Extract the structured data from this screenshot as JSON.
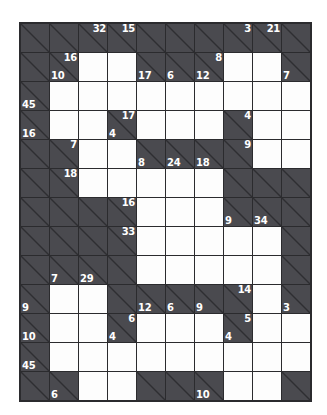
{
  "puzzle": {
    "type": "kakuro",
    "columns": 10,
    "rows": 13,
    "colors": {
      "open_cell": "#fdfdfd",
      "clue_cell": "#4a4a4f",
      "grid_line": "#2b2b2e",
      "clue_text": "#ffffff",
      "page_background": "#ffffff"
    },
    "grid": [
      [
        {
          "kind": "block"
        },
        {
          "kind": "block"
        },
        {
          "kind": "clue",
          "down": "32"
        },
        {
          "kind": "clue",
          "down": "15"
        },
        {
          "kind": "block"
        },
        {
          "kind": "block"
        },
        {
          "kind": "block"
        },
        {
          "kind": "clue",
          "down": "3"
        },
        {
          "kind": "clue",
          "down": "21"
        },
        {
          "kind": "block"
        }
      ],
      [
        {
          "kind": "block"
        },
        {
          "kind": "clue",
          "down": "16",
          "across": "10"
        },
        {
          "kind": "open"
        },
        {
          "kind": "open"
        },
        {
          "kind": "clue",
          "across": "17"
        },
        {
          "kind": "clue",
          "across": "6"
        },
        {
          "kind": "clue",
          "down": "8",
          "across": "12"
        },
        {
          "kind": "open"
        },
        {
          "kind": "open"
        },
        {
          "kind": "clue",
          "across": "7"
        }
      ],
      [
        {
          "kind": "clue",
          "across": "45"
        },
        {
          "kind": "open"
        },
        {
          "kind": "open"
        },
        {
          "kind": "open"
        },
        {
          "kind": "open"
        },
        {
          "kind": "open"
        },
        {
          "kind": "open"
        },
        {
          "kind": "open"
        },
        {
          "kind": "open"
        },
        {
          "kind": "open"
        }
      ],
      [
        {
          "kind": "clue",
          "across": "16"
        },
        {
          "kind": "open"
        },
        {
          "kind": "open"
        },
        {
          "kind": "clue",
          "down": "17",
          "across": "4"
        },
        {
          "kind": "open"
        },
        {
          "kind": "open"
        },
        {
          "kind": "open"
        },
        {
          "kind": "clue",
          "down": "4"
        },
        {
          "kind": "open"
        },
        {
          "kind": "open"
        }
      ],
      [
        {
          "kind": "block"
        },
        {
          "kind": "clue",
          "down": "7"
        },
        {
          "kind": "open"
        },
        {
          "kind": "open"
        },
        {
          "kind": "clue",
          "across": "8"
        },
        {
          "kind": "clue",
          "across": "24"
        },
        {
          "kind": "clue",
          "across": "18"
        },
        {
          "kind": "clue",
          "down": "9"
        },
        {
          "kind": "open"
        },
        {
          "kind": "open"
        }
      ],
      [
        {
          "kind": "block"
        },
        {
          "kind": "clue",
          "down": "18"
        },
        {
          "kind": "open"
        },
        {
          "kind": "open"
        },
        {
          "kind": "open"
        },
        {
          "kind": "open"
        },
        {
          "kind": "open"
        },
        {
          "kind": "block"
        },
        {
          "kind": "block"
        },
        {
          "kind": "block"
        }
      ],
      [
        {
          "kind": "block"
        },
        {
          "kind": "block"
        },
        {
          "kind": "block"
        },
        {
          "kind": "clue",
          "down": "16"
        },
        {
          "kind": "open"
        },
        {
          "kind": "open"
        },
        {
          "kind": "open"
        },
        {
          "kind": "clue",
          "across": "9"
        },
        {
          "kind": "clue",
          "across": "34"
        },
        {
          "kind": "block"
        }
      ],
      [
        {
          "kind": "block"
        },
        {
          "kind": "block"
        },
        {
          "kind": "block"
        },
        {
          "kind": "clue",
          "down": "33"
        },
        {
          "kind": "open"
        },
        {
          "kind": "open"
        },
        {
          "kind": "open"
        },
        {
          "kind": "open"
        },
        {
          "kind": "open"
        },
        {
          "kind": "block"
        }
      ],
      [
        {
          "kind": "block"
        },
        {
          "kind": "clue",
          "across": "7"
        },
        {
          "kind": "clue",
          "across": "29"
        },
        {
          "kind": "block"
        },
        {
          "kind": "open"
        },
        {
          "kind": "open"
        },
        {
          "kind": "open"
        },
        {
          "kind": "open"
        },
        {
          "kind": "open"
        },
        {
          "kind": "block"
        }
      ],
      [
        {
          "kind": "clue",
          "across": "9"
        },
        {
          "kind": "open"
        },
        {
          "kind": "open"
        },
        {
          "kind": "block"
        },
        {
          "kind": "clue",
          "across": "12"
        },
        {
          "kind": "clue",
          "across": "6"
        },
        {
          "kind": "clue",
          "across": "9"
        },
        {
          "kind": "clue",
          "down": "14"
        },
        {
          "kind": "open"
        },
        {
          "kind": "clue",
          "across": "3"
        }
      ],
      [
        {
          "kind": "clue",
          "across": "10"
        },
        {
          "kind": "open"
        },
        {
          "kind": "open"
        },
        {
          "kind": "clue",
          "down": "6",
          "across": "4"
        },
        {
          "kind": "open"
        },
        {
          "kind": "open"
        },
        {
          "kind": "open"
        },
        {
          "kind": "clue",
          "down": "5",
          "across": "4"
        },
        {
          "kind": "open"
        },
        {
          "kind": "open"
        }
      ],
      [
        {
          "kind": "clue",
          "across": "45"
        },
        {
          "kind": "open"
        },
        {
          "kind": "open"
        },
        {
          "kind": "open"
        },
        {
          "kind": "open"
        },
        {
          "kind": "open"
        },
        {
          "kind": "open"
        },
        {
          "kind": "open"
        },
        {
          "kind": "open"
        },
        {
          "kind": "open"
        }
      ],
      [
        {
          "kind": "block"
        },
        {
          "kind": "clue",
          "across": "6"
        },
        {
          "kind": "open"
        },
        {
          "kind": "open"
        },
        {
          "kind": "block"
        },
        {
          "kind": "block"
        },
        {
          "kind": "clue",
          "across": "10"
        },
        {
          "kind": "open"
        },
        {
          "kind": "open"
        },
        {
          "kind": "block"
        }
      ]
    ]
  }
}
